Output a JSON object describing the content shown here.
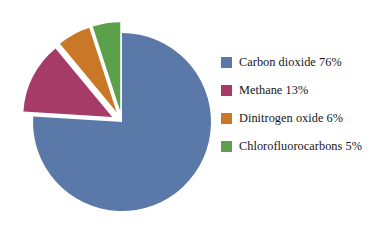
{
  "chart_data": {
    "type": "pie",
    "title": "",
    "subtitle": "",
    "xlabel": "",
    "ylabel": "",
    "grid": false,
    "legend_position": "right",
    "units": "%",
    "start_angle_deg": 0,
    "direction": "clockwise",
    "categories": [
      "Carbon dioxide",
      "Methane",
      "Dinitrogen oxide",
      "Chlorofluorocarbons"
    ],
    "values": [
      76,
      13,
      6,
      5
    ],
    "colors": [
      "#5b79a8",
      "#a63b68",
      "#ca7828",
      "#5ba04b"
    ],
    "exploded": [
      false,
      true,
      true,
      true
    ],
    "slices": [
      {
        "label": "Carbon dioxide",
        "value": 76,
        "value_text": "76%",
        "color": "#5b79a8",
        "exploded": false
      },
      {
        "label": "Methane",
        "value": 13,
        "value_text": "13%",
        "color": "#a63b68",
        "exploded": true
      },
      {
        "label": "Dinitrogen oxide",
        "value": 6,
        "value_text": "6%",
        "color": "#ca7828",
        "exploded": true
      },
      {
        "label": "Chlorofluorocarbons",
        "value": 5,
        "value_text": "5%",
        "color": "#5ba04b",
        "exploded": true
      }
    ]
  },
  "legend": {
    "items": [
      {
        "label": "Carbon dioxide 76%",
        "color": "#5b79a8",
        "swatch_name": "legend-swatch-carbon-dioxide"
      },
      {
        "label": "Methane 13%",
        "color": "#a63b68",
        "swatch_name": "legend-swatch-methane"
      },
      {
        "label": "Dinitrogen oxide 6%",
        "color": "#ca7828",
        "swatch_name": "legend-swatch-dinitrogen-oxide"
      },
      {
        "label": "Chlorofluorocarbons 5%",
        "color": "#5ba04b",
        "swatch_name": "legend-swatch-chlorofluorocarbons"
      }
    ]
  },
  "canvas": {
    "background": "#ffffff",
    "center_x": 122,
    "center_y": 122,
    "radius": 89,
    "explode_offset": 11
  }
}
